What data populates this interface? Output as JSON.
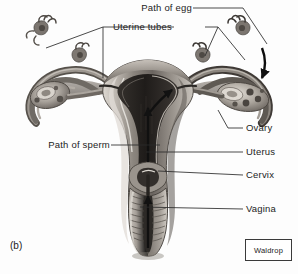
{
  "figure": {
    "letter": "(b)",
    "credit": "Waldrop"
  },
  "labels": {
    "path_of_egg": "Path of egg",
    "uterine_tubes": "Uterine tubes",
    "path_of_sperm": "Path of sperm",
    "ovary": "Ovary",
    "uterus": "Uterus",
    "cervix": "Cervix",
    "vagina": "Vagina"
  },
  "colors": {
    "ink": "#1c1c1c",
    "leader": "#2b2b2b",
    "background": "#fdfdfd",
    "tissue_light": "#b9b4ae",
    "tissue_mid": "#8d8781",
    "tissue_dark": "#4a4540",
    "cavity": "#2a2724",
    "highlight": "#e4e0da"
  }
}
